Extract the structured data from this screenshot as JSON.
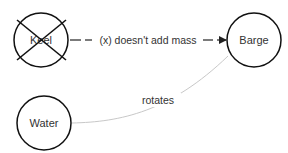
{
  "diagram": {
    "nodes": [
      {
        "id": "keel",
        "label": "Keel",
        "crossed_out": true
      },
      {
        "id": "barge",
        "label": "Barge",
        "crossed_out": false
      },
      {
        "id": "water",
        "label": "Water",
        "crossed_out": false
      }
    ],
    "edges": [
      {
        "from": "keel",
        "to": "barge",
        "label": "(x) doesn't add mass",
        "style": "dashed",
        "color": "#222222"
      },
      {
        "from": "water",
        "to": "barge",
        "label": "rotates",
        "style": "solid-curved",
        "color": "#c8c8c8"
      }
    ]
  },
  "colors": {
    "node_stroke": "#111111",
    "text": "#333333",
    "light_edge": "#c8c8c8",
    "background": "#ffffff"
  }
}
